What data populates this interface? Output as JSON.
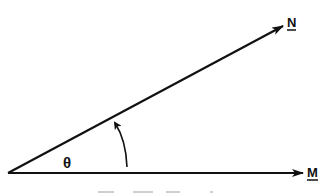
{
  "diagram": {
    "vectors": [
      {
        "name": "N",
        "label": "N"
      },
      {
        "name": "M",
        "label": "M"
      }
    ],
    "angle": {
      "label": "θ"
    },
    "colors": {
      "ink": "#111111",
      "background": "#ffffff"
    }
  }
}
